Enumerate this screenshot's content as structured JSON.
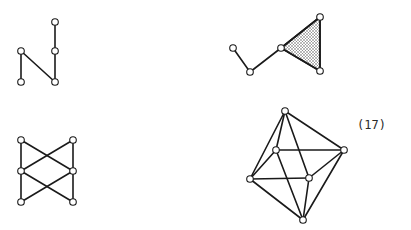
{
  "equation_label": "(17)",
  "colors": {
    "stroke": "#1a1a1a",
    "node_fill": "#ffffff",
    "hatch_fill": "#b8b8b8"
  },
  "graphs": [
    {
      "id": "graph-n-shape",
      "nodes": [
        {
          "id": "a",
          "x": 21,
          "y": 51
        },
        {
          "id": "b",
          "x": 21,
          "y": 82
        },
        {
          "id": "c",
          "x": 55,
          "y": 82
        },
        {
          "id": "d",
          "x": 55,
          "y": 51
        },
        {
          "id": "e",
          "x": 55,
          "y": 22
        }
      ],
      "edges": [
        [
          "a",
          "b"
        ],
        [
          "a",
          "c"
        ],
        [
          "c",
          "d"
        ],
        [
          "d",
          "e"
        ]
      ],
      "faces": []
    },
    {
      "id": "graph-path-triangle",
      "nodes": [
        {
          "id": "p1",
          "x": 233,
          "y": 48
        },
        {
          "id": "p2",
          "x": 250,
          "y": 72
        },
        {
          "id": "p3",
          "x": 281,
          "y": 48
        },
        {
          "id": "p4",
          "x": 320,
          "y": 17
        },
        {
          "id": "p5",
          "x": 320,
          "y": 71
        }
      ],
      "edges": [
        [
          "p1",
          "p2"
        ],
        [
          "p2",
          "p3"
        ],
        [
          "p3",
          "p4"
        ],
        [
          "p4",
          "p5"
        ],
        [
          "p3",
          "p5"
        ]
      ],
      "faces": [
        [
          "p3",
          "p4",
          "p5"
        ]
      ]
    },
    {
      "id": "graph-bowtie",
      "nodes": [
        {
          "id": "tl",
          "x": 21,
          "y": 140
        },
        {
          "id": "ml",
          "x": 21,
          "y": 171
        },
        {
          "id": "bl",
          "x": 21,
          "y": 202
        },
        {
          "id": "tr",
          "x": 73,
          "y": 140
        },
        {
          "id": "mr",
          "x": 73,
          "y": 171
        },
        {
          "id": "br",
          "x": 73,
          "y": 202
        }
      ],
      "edges": [
        [
          "tl",
          "ml"
        ],
        [
          "ml",
          "bl"
        ],
        [
          "tr",
          "mr"
        ],
        [
          "mr",
          "br"
        ],
        [
          "tl",
          "mr"
        ],
        [
          "tr",
          "ml"
        ],
        [
          "ml",
          "br"
        ],
        [
          "mr",
          "bl"
        ]
      ],
      "faces": []
    },
    {
      "id": "graph-octahedron",
      "nodes": [
        {
          "id": "top",
          "x": 285,
          "y": 111
        },
        {
          "id": "ml",
          "x": 276,
          "y": 150
        },
        {
          "id": "r",
          "x": 344,
          "y": 150
        },
        {
          "id": "l",
          "x": 250,
          "y": 179
        },
        {
          "id": "mr",
          "x": 309,
          "y": 178
        },
        {
          "id": "bot",
          "x": 303,
          "y": 220
        }
      ],
      "edges": [
        [
          "top",
          "ml"
        ],
        [
          "top",
          "r"
        ],
        [
          "top",
          "l"
        ],
        [
          "top",
          "mr"
        ],
        [
          "ml",
          "r"
        ],
        [
          "ml",
          "l"
        ],
        [
          "ml",
          "bot"
        ],
        [
          "l",
          "mr"
        ],
        [
          "mr",
          "r"
        ],
        [
          "r",
          "bot"
        ],
        [
          "l",
          "bot"
        ],
        [
          "mr",
          "bot"
        ]
      ],
      "faces": []
    }
  ]
}
